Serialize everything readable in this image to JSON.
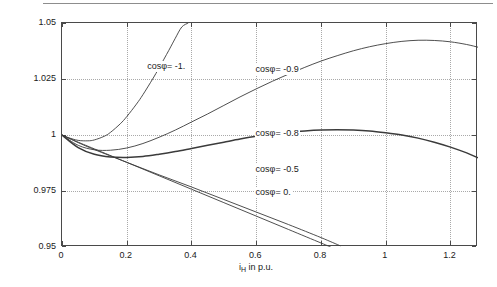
{
  "chart_data": {
    "type": "line",
    "title": "",
    "xlabel": "i_H in p.u.",
    "ylabel": "u_H(i_H) in p.u.",
    "xlim": [
      0,
      1.285
    ],
    "ylim": [
      0.95,
      1.05
    ],
    "xticks": [
      0,
      0.2,
      0.4,
      0.6,
      0.8,
      1,
      1.2
    ],
    "xticklabels": [
      "0",
      "0.2",
      "0.4",
      "0.6",
      "0.8",
      "1",
      "1.2"
    ],
    "yticks": [
      0.95,
      0.975,
      1,
      1.025,
      1.05
    ],
    "yticklabels": [
      "0.95",
      "0.975",
      "1",
      "1.025",
      "1.05"
    ],
    "grid": true,
    "legend_position": "inline-annotations",
    "series": [
      {
        "name": "cosφ= -1.",
        "label": "cosφ= -1.",
        "label_x": 0.26,
        "label_y": 1.0305,
        "linewidth": 0.9,
        "color": "#3b3b3b",
        "x": [
          0,
          0.02,
          0.05,
          0.08,
          0.1,
          0.13,
          0.15,
          0.18,
          0.2,
          0.23,
          0.25,
          0.28,
          0.3,
          0.33,
          0.35,
          0.37,
          0.39
        ],
        "y": [
          1.0,
          0.9988,
          0.9976,
          0.9974,
          0.9978,
          0.9994,
          1.0012,
          1.005,
          1.0082,
          1.0138,
          1.018,
          1.025,
          1.03,
          1.0378,
          1.0432,
          1.0482,
          1.05
        ]
      },
      {
        "name": "cosφ= -0.9",
        "label": "cosφ= -0.9",
        "label_x": 0.595,
        "label_y": 1.0292,
        "linewidth": 0.9,
        "color": "#3b3b3b",
        "x": [
          0,
          0.05,
          0.1,
          0.15,
          0.2,
          0.25,
          0.3,
          0.35,
          0.4,
          0.45,
          0.5,
          0.55,
          0.6,
          0.65,
          0.7,
          0.75,
          0.8,
          0.85,
          0.9,
          0.95,
          1.0,
          1.05,
          1.1,
          1.15,
          1.2,
          1.25,
          1.285
        ],
        "y": [
          1.0,
          0.9954,
          0.9934,
          0.9932,
          0.9942,
          0.9962,
          0.999,
          1.0022,
          1.0058,
          1.0094,
          1.0132,
          1.017,
          1.0206,
          1.024,
          1.0272,
          1.0302,
          1.033,
          1.0354,
          1.0376,
          1.0394,
          1.0408,
          1.0418,
          1.0423,
          1.0422,
          1.0416,
          1.0404,
          1.0392
        ]
      },
      {
        "name": "cosφ= -0.8",
        "label": "cosφ= -0.8",
        "label_x": 0.595,
        "label_y": 1.0005,
        "linewidth": 1.5,
        "color": "#3b3b3b",
        "x": [
          0,
          0.05,
          0.1,
          0.15,
          0.2,
          0.25,
          0.3,
          0.35,
          0.4,
          0.45,
          0.5,
          0.55,
          0.6,
          0.65,
          0.7,
          0.75,
          0.8,
          0.85,
          0.9,
          0.95,
          1.0,
          1.05,
          1.1,
          1.15,
          1.2,
          1.25,
          1.285
        ],
        "y": [
          1.0,
          0.9944,
          0.9914,
          0.9902,
          0.99,
          0.9904,
          0.9914,
          0.9926,
          0.994,
          0.9954,
          0.9968,
          0.9982,
          0.9994,
          1.0004,
          1.0012,
          1.0018,
          1.0022,
          1.0023,
          1.0022,
          1.0018,
          1.001,
          1.0,
          0.9986,
          0.9968,
          0.9946,
          0.992,
          0.9898
        ]
      },
      {
        "name": "cosφ= -0.5",
        "label": "cosφ= -0.5",
        "label_x": 0.595,
        "label_y": 0.9845,
        "linewidth": 0.9,
        "color": "#3b3b3b",
        "x": [
          0,
          0.05,
          0.1,
          0.2,
          0.3,
          0.4,
          0.5,
          0.6,
          0.7,
          0.8,
          0.86
        ],
        "y": [
          1.0,
          0.9966,
          0.9935,
          0.9878,
          0.9822,
          0.9768,
          0.9712,
          0.9656,
          0.96,
          0.9542,
          0.9505
        ]
      },
      {
        "name": "cosφ= 0.",
        "label": "cosφ= 0.",
        "label_x": 0.595,
        "label_y": 0.974,
        "linewidth": 0.9,
        "color": "#3b3b3b",
        "x": [
          0,
          0.05,
          0.1,
          0.2,
          0.3,
          0.4,
          0.5,
          0.6,
          0.7,
          0.8,
          0.83
        ],
        "y": [
          1.0,
          0.9968,
          0.9938,
          0.9878,
          0.9818,
          0.9758,
          0.9698,
          0.9638,
          0.9578,
          0.9518,
          0.95
        ]
      }
    ]
  }
}
